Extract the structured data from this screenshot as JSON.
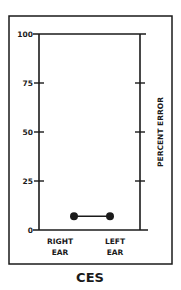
{
  "chart_data": {
    "type": "line",
    "title": "CES",
    "xlabel": "",
    "ylabel": "PERCENT ERROR",
    "ylim": [
      0,
      100
    ],
    "yticks": [
      0,
      25,
      50,
      75,
      100
    ],
    "ytick_labels": [
      "0",
      "25",
      "50",
      "75",
      "100"
    ],
    "categories": [
      "RIGHT EAR",
      "LEFT EAR"
    ],
    "category_lines": [
      [
        "RIGHT",
        "EAR"
      ],
      [
        "LEFT",
        "EAR"
      ]
    ],
    "series": [
      {
        "name": "CES",
        "values": [
          7,
          7
        ],
        "marker": "filled-circle",
        "color": "#1a1a1a"
      }
    ],
    "grid": false,
    "legend": null
  },
  "colors": {
    "ink": "#1a1a1a",
    "background": "#ffffff"
  }
}
